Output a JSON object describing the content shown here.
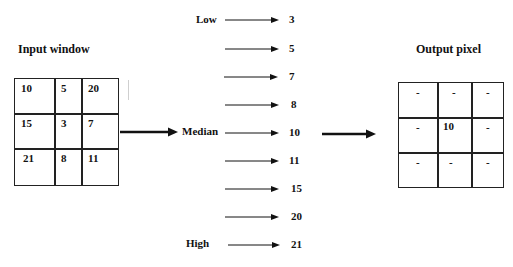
{
  "input": {
    "title": "Input window",
    "cells": [
      [
        "10",
        "5",
        "20"
      ],
      [
        "15",
        "3",
        "7"
      ],
      [
        "21",
        "8",
        "11"
      ]
    ]
  },
  "sorted": {
    "low_label": "Low",
    "median_label": "Median",
    "high_label": "High",
    "values": [
      "3",
      "5",
      "7",
      "8",
      "10",
      "11",
      "15",
      "20",
      "21"
    ]
  },
  "output": {
    "title": "Output pixel",
    "cells": [
      [
        "-",
        "-",
        "-"
      ],
      [
        "-",
        "10",
        "-"
      ],
      [
        "-",
        "-",
        "-"
      ]
    ]
  }
}
